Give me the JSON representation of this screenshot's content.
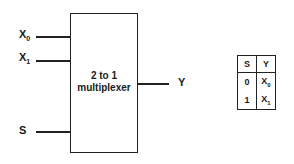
{
  "diagram": {
    "block": {
      "label_line1": "2 to 1",
      "label_line2": "multiplexer"
    },
    "inputs": [
      {
        "base": "X",
        "sub": "0"
      },
      {
        "base": "X",
        "sub": "1"
      },
      {
        "base": "S",
        "sub": ""
      }
    ],
    "output": {
      "label": "Y"
    },
    "truth_table": {
      "headers": [
        "S",
        "Y"
      ],
      "rows": [
        {
          "s": "0",
          "y_base": "X",
          "y_sub": "0"
        },
        {
          "s": "1",
          "y_base": "X",
          "y_sub": "1"
        }
      ]
    }
  }
}
